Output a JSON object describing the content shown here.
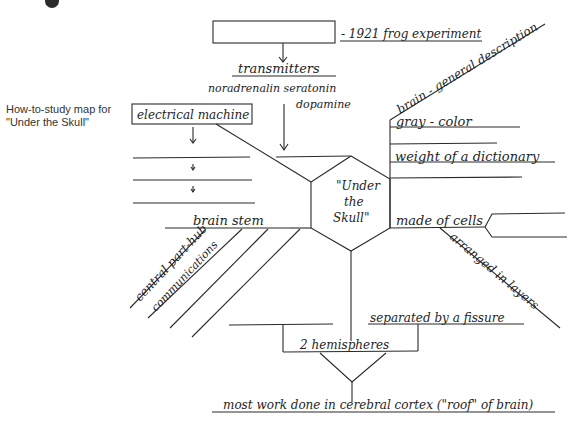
{
  "caption": {
    "line1": "How-to-study map for",
    "line2": "\"Under the Skull\""
  },
  "center": {
    "line1": "\"Under",
    "line2": "the",
    "line3": "Skull\""
  },
  "top_branch": {
    "box_note": "- 1921 frog experiment",
    "heading": "transmitters",
    "items_line1": "noradrenalin seratonin",
    "items_line2": "dopamine"
  },
  "left_branch": {
    "box": "electrical machine",
    "bottom": "brain stem",
    "diagonals": [
      "central part-hub",
      "communications"
    ]
  },
  "right_branch": {
    "diagonal": "brain - general description",
    "items": [
      "gray - color",
      "weight of a dictionary"
    ],
    "cells": "made of cells",
    "cells_sub": "arranged in layers"
  },
  "bottom_branch": {
    "separated": "separated by a fissure",
    "hemispheres": "2 hemispheres",
    "cortex": "most work done in cerebral cortex (\"roof\" of brain)"
  },
  "colors": {
    "ink": "#2a2a2a",
    "background": "#ffffff"
  }
}
